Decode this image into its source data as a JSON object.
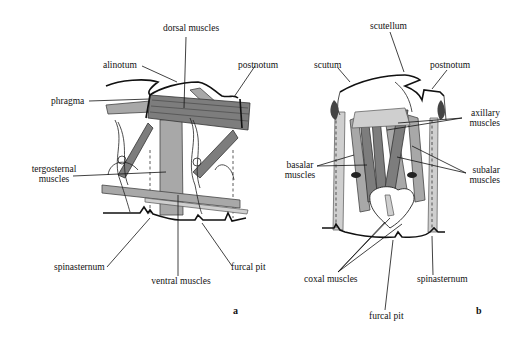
{
  "figure": {
    "panels": [
      {
        "id": "a",
        "label": "a",
        "annotations": {
          "dorsal_muscles": "dorsal muscles",
          "alinotum": "alinotum",
          "postnotum": "postnotum",
          "phragma": "phragma",
          "tergosternal_muscles_1": "tergosternal",
          "tergosternal_muscles_2": "muscles",
          "spinasternum": "spinasternum",
          "furcal_pit": "furcal pit",
          "ventral_muscles": "ventral muscles"
        }
      },
      {
        "id": "b",
        "label": "b",
        "annotations": {
          "scutellum": "scutellum",
          "scutum": "scutum",
          "postnotum": "postnotum",
          "axillary_muscles_1": "axillary",
          "axillary_muscles_2": "muscles",
          "basalar_muscles_1": "basalar",
          "basalar_muscles_2": "muscles",
          "subalar_muscles_1": "subalar",
          "subalar_muscles_2": "muscles",
          "coxal_muscles": "coxal muscles",
          "spinasternum": "spinasternum",
          "furcal_pit": "furcal pit"
        }
      }
    ]
  }
}
